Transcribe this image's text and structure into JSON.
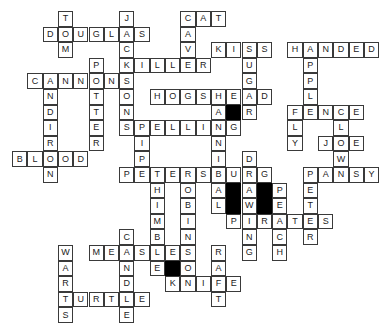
{
  "puzzle": {
    "type": "crossword",
    "grid": {
      "origin_x": 12,
      "origin_y": 11,
      "col_pitch": 15.3,
      "row_pitch": 15.6
    },
    "colors": {
      "border": "#3a3a3a",
      "fill": "#ffffff",
      "block": "#000000",
      "text": "#222222"
    },
    "words": [
      {
        "word": "TOM",
        "dir": "down",
        "row": 0,
        "col": 3
      },
      {
        "word": "DOUGLAS",
        "dir": "across",
        "row": 1,
        "col": 2
      },
      {
        "word": "JACKSONS",
        "dir": "down",
        "row": 0,
        "col": 7
      },
      {
        "word": "CAT",
        "dir": "across",
        "row": 0,
        "col": 11
      },
      {
        "word": "CAVE",
        "dir": "down",
        "row": 0,
        "col": 11
      },
      {
        "word": "KISS",
        "dir": "across",
        "row": 2,
        "col": 13
      },
      {
        "word": "KILLER",
        "dir": "across",
        "row": 3,
        "col": 7
      },
      {
        "word": "SUGAR",
        "dir": "down",
        "row": 2,
        "col": 15
      },
      {
        "word": "HANDED",
        "dir": "across",
        "row": 2,
        "col": 18
      },
      {
        "word": "APPLE",
        "dir": "down",
        "row": 2,
        "col": 19
      },
      {
        "word": "POTTER",
        "dir": "down",
        "row": 3,
        "col": 5
      },
      {
        "word": "CANNONS",
        "dir": "across",
        "row": 4,
        "col": 1
      },
      {
        "word": "ANDIRON",
        "dir": "down",
        "row": 4,
        "col": 2
      },
      {
        "word": "HOGSHEAD",
        "dir": "across",
        "row": 5,
        "col": 9
      },
      {
        "word": "HANNIBAL",
        "dir": "down",
        "row": 5,
        "col": 13
      },
      {
        "word": "FENCE",
        "dir": "across",
        "row": 6,
        "col": 18
      },
      {
        "word": "FLY",
        "dir": "down",
        "row": 6,
        "col": 18
      },
      {
        "word": "CLOWN",
        "dir": "down",
        "row": 6,
        "col": 21
      },
      {
        "word": "SPELLING",
        "dir": "across",
        "row": 7,
        "col": 7
      },
      {
        "word": "PIPE",
        "dir": "down",
        "row": 7,
        "col": 8
      },
      {
        "word": "JOE",
        "dir": "across",
        "row": 8,
        "col": 20
      },
      {
        "word": "BLOOD",
        "dir": "across",
        "row": 9,
        "col": 0
      },
      {
        "word": "DRAWING",
        "dir": "down",
        "row": 9,
        "col": 15
      },
      {
        "word": "PETERSBURG",
        "dir": "across",
        "row": 10,
        "col": 7
      },
      {
        "word": "PANSY",
        "dir": "across",
        "row": 10,
        "col": 19
      },
      {
        "word": "PETER",
        "dir": "down",
        "row": 10,
        "col": 19
      },
      {
        "word": "THIMBLE",
        "dir": "down",
        "row": 10,
        "col": 9
      },
      {
        "word": "ROBINSON",
        "dir": "down",
        "row": 10,
        "col": 11
      },
      {
        "word": "PEACH",
        "dir": "down",
        "row": 11,
        "col": 17
      },
      {
        "word": "PIRATES",
        "dir": "across",
        "row": 13,
        "col": 14
      },
      {
        "word": "CANDLE",
        "dir": "down",
        "row": 14,
        "col": 7
      },
      {
        "word": "MEASLES",
        "dir": "across",
        "row": 15,
        "col": 5
      },
      {
        "word": "WARTS",
        "dir": "down",
        "row": 15,
        "col": 3
      },
      {
        "word": "RAFT",
        "dir": "down",
        "row": 15,
        "col": 13
      },
      {
        "word": "KNIFE",
        "dir": "across",
        "row": 17,
        "col": 10
      },
      {
        "word": "TURTLE",
        "dir": "across",
        "row": 18,
        "col": 3
      }
    ],
    "black_cells": [
      {
        "row": 6,
        "col": 14
      },
      {
        "row": 11,
        "col": 14
      },
      {
        "row": 12,
        "col": 14
      },
      {
        "row": 11,
        "col": 16
      },
      {
        "row": 12,
        "col": 16
      },
      {
        "row": 16,
        "col": 10
      }
    ]
  }
}
